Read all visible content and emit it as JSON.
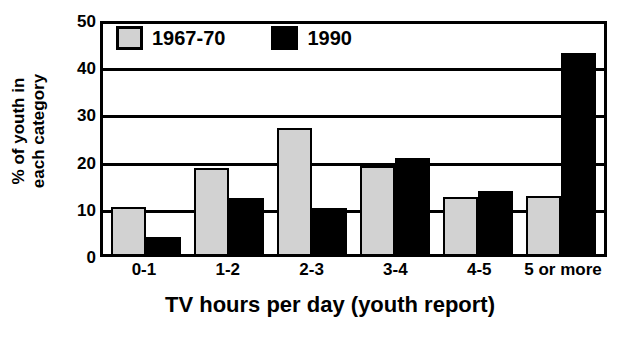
{
  "chart_data": {
    "type": "bar",
    "title": "",
    "subtitle": "",
    "xlabel": "TV hours per day (youth report)",
    "ylabel_line1": "% of youth in",
    "ylabel_line2": "each category",
    "categories": [
      "0-1",
      "1-2",
      "2-3",
      "3-4",
      "4-5",
      "5 or more"
    ],
    "series": [
      {
        "name": "1967-70",
        "color": "#d2d2d2",
        "values": [
          10.2,
          18.5,
          27.0,
          19.0,
          12.2,
          12.4
        ]
      },
      {
        "name": "1990",
        "color": "#000000",
        "values": [
          3.7,
          12.1,
          9.9,
          20.6,
          13.6,
          43.2
        ]
      }
    ],
    "ylim": [
      0,
      50
    ],
    "ytick_labels": [
      "50",
      "40",
      "30",
      "20",
      "10",
      "0"
    ],
    "ytick_values": [
      50,
      40,
      30,
      20,
      10,
      0
    ],
    "grid": true,
    "legend_position": "top-left"
  }
}
